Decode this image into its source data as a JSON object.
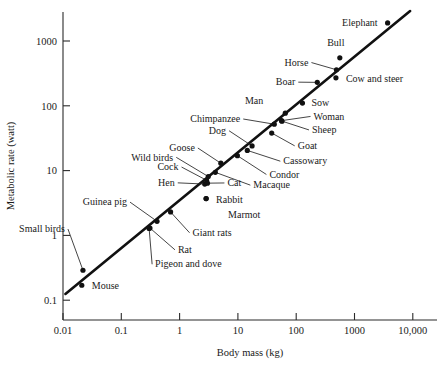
{
  "chart_data": {
    "type": "scatter",
    "title": "",
    "xlabel": "Body mass (kg)",
    "ylabel": "Metabolic rate (watt)",
    "xscale": "log",
    "yscale": "log",
    "xlim": [
      0.01,
      10000
    ],
    "ylim": [
      0.1,
      3000
    ],
    "grid": false,
    "legend": "none",
    "xticks": [
      "0.01",
      "0.1",
      "1",
      "10",
      "100",
      "1000",
      "10,000"
    ],
    "xtick_values": [
      0.01,
      0.1,
      1,
      10,
      100,
      1000,
      10000
    ],
    "yticks": [
      "0.1",
      "1",
      "10",
      "100",
      "1000"
    ],
    "ytick_values": [
      0.1,
      1,
      10,
      100,
      1000
    ],
    "trendline": {
      "label": "",
      "note": "Kleiber allometric fit, slope 3/4 on log-log axes",
      "x_start": 0.011,
      "y_start": 0.125,
      "x_end": 9000,
      "y_end": 2900
    },
    "points": [
      {
        "label": "Mouse",
        "x": 0.021,
        "y": 0.17,
        "label_dx": 10,
        "label_dy": 4,
        "anchor": "start",
        "leader": false
      },
      {
        "label": "Small birds",
        "x": 0.022,
        "y": 0.29,
        "label_dx": -18,
        "label_dy": -38,
        "anchor": "end",
        "leader": true
      },
      {
        "label": "Guinea pig",
        "x": 0.41,
        "y": 1.65,
        "label_dx": -30,
        "label_dy": -16,
        "anchor": "end",
        "leader": true
      },
      {
        "label": "Pigeon and dove",
        "x": 0.3,
        "y": 1.28,
        "label_dx": 6,
        "label_dy": 39,
        "anchor": "start",
        "leader": true
      },
      {
        "label": "Rat",
        "x": 0.31,
        "y": 1.3,
        "label_dx": 28,
        "label_dy": 25,
        "anchor": "start",
        "leader": true
      },
      {
        "label": "Giant rats",
        "x": 0.7,
        "y": 2.3,
        "label_dx": 22,
        "label_dy": 24,
        "anchor": "start",
        "leader": true
      },
      {
        "label": "Hen",
        "x": 2.7,
        "y": 6.2,
        "label_dx": -30,
        "label_dy": 2,
        "anchor": "end",
        "leader": true
      },
      {
        "label": "Cock",
        "x": 2.9,
        "y": 7.1,
        "label_dx": -28,
        "label_dy": -10,
        "anchor": "end",
        "leader": true
      },
      {
        "label": "Cat",
        "x": 3.0,
        "y": 6.4,
        "label_dx": 20,
        "label_dy": 3,
        "anchor": "start",
        "leader": true
      },
      {
        "label": "Rabbit",
        "x": 2.85,
        "y": 3.7,
        "label_dx": 10,
        "label_dy": 4,
        "anchor": "start",
        "leader": false
      },
      {
        "label": "Marmot",
        "x": 2.85,
        "y": 3.7,
        "label_dx": 22,
        "label_dy": 19,
        "anchor": "start",
        "leader": false
      },
      {
        "label": "Wild birds",
        "x": 3.1,
        "y": 8.1,
        "label_dx": -35,
        "label_dy": -16,
        "anchor": "end",
        "leader": true
      },
      {
        "label": "Macaque",
        "x": 4.1,
        "y": 9.4,
        "label_dx": 38,
        "label_dy": 16,
        "anchor": "start",
        "leader": true
      },
      {
        "label": "Goose",
        "x": 5.1,
        "y": 13.0,
        "label_dx": -26,
        "label_dy": -12,
        "anchor": "end",
        "leader": true
      },
      {
        "label": "Condor",
        "x": 9.8,
        "y": 17.0,
        "label_dx": 32,
        "label_dy": 22,
        "anchor": "start",
        "leader": true
      },
      {
        "label": "Cassowary",
        "x": 14.5,
        "y": 20.5,
        "label_dx": 36,
        "label_dy": 14,
        "anchor": "start",
        "leader": true
      },
      {
        "label": "Dog",
        "x": 17.5,
        "y": 24.0,
        "label_dx": -26,
        "label_dy": -12,
        "anchor": "end",
        "leader": true
      },
      {
        "label": "Goat",
        "x": 38.0,
        "y": 38.0,
        "label_dx": 26,
        "label_dy": 16,
        "anchor": "start",
        "leader": true
      },
      {
        "label": "Sheep",
        "x": 57.0,
        "y": 58.0,
        "label_dx": 30,
        "label_dy": 12,
        "anchor": "start",
        "leader": true
      },
      {
        "label": "Woman",
        "x": 56.0,
        "y": 59.0,
        "label_dx": 32,
        "label_dy": -1,
        "anchor": "start",
        "leader": true
      },
      {
        "label": "Chimpanzee",
        "x": 42.0,
        "y": 52.0,
        "label_dx": -34,
        "label_dy": -2,
        "anchor": "end",
        "leader": true
      },
      {
        "label": "Man",
        "x": 65.0,
        "y": 77.0,
        "label_dx": -22,
        "label_dy": -9,
        "anchor": "end",
        "leader": false
      },
      {
        "label": "Sow",
        "x": 128.0,
        "y": 110.0,
        "label_dx": 9,
        "label_dy": 3,
        "anchor": "start",
        "leader": false
      },
      {
        "label": "Boar",
        "x": 230.0,
        "y": 230.0,
        "label_dx": -22,
        "label_dy": 3,
        "anchor": "end",
        "leader": true
      },
      {
        "label": "Cow and steer",
        "x": 480.0,
        "y": 270.0,
        "label_dx": 10,
        "label_dy": 4,
        "anchor": "start",
        "leader": false
      },
      {
        "label": "Horse",
        "x": 490.0,
        "y": 360.0,
        "label_dx": -28,
        "label_dy": -4,
        "anchor": "end",
        "leader": true
      },
      {
        "label": "Bull",
        "x": 560.0,
        "y": 550.0,
        "label_dx": -4,
        "label_dy": -12,
        "anchor": "middle",
        "leader": false
      },
      {
        "label": "Elephant",
        "x": 3700.0,
        "y": 1900.0,
        "label_dx": -10,
        "label_dy": 3,
        "anchor": "end",
        "leader": false
      }
    ]
  }
}
